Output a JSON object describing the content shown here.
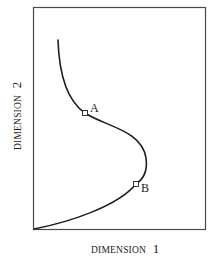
{
  "diagram": {
    "x_axis_label": "DIMENSION",
    "x_axis_number": "1",
    "y_axis_label": "DIMENSION",
    "y_axis_number": "2",
    "points": [
      {
        "label": "A",
        "x": 85,
        "y": 113
      },
      {
        "label": "B",
        "x": 136,
        "y": 184
      }
    ],
    "colors": {
      "frame": "#4a4a4a",
      "curve": "#1e1e1e",
      "text": "#222222",
      "background": "#ffffff"
    }
  }
}
